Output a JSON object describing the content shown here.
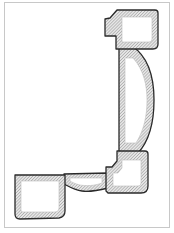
{
  "figure": {
    "colors": {
      "background": "#ffffff",
      "outline": "#2a2a2a",
      "hatch": "#8a8a8a",
      "frame": "#c8c8c8"
    },
    "parts": [
      {
        "name": "top-block",
        "label": "Top block"
      },
      {
        "name": "arched-link",
        "label": "Arched vertical link"
      },
      {
        "name": "lower-right-block",
        "label": "Lower-right block"
      },
      {
        "name": "connecting-bar",
        "label": "Connecting bar"
      },
      {
        "name": "lower-left-block",
        "label": "Lower-left block"
      }
    ]
  }
}
